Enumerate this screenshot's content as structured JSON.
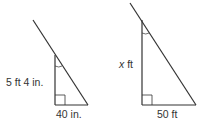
{
  "figures": [
    {
      "name": "left-triangle",
      "vertical_label": "5 ft 4 in.",
      "base_label": "40 in."
    },
    {
      "name": "right-triangle",
      "vertical_var": "x",
      "vertical_unit": " ft",
      "base_label": "50 ft"
    }
  ],
  "colors": {
    "stroke": "#333333",
    "text": "#333333"
  }
}
